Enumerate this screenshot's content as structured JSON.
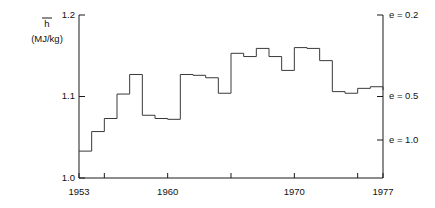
{
  "chart_data": {
    "type": "line",
    "subtype": "step-post",
    "title": "",
    "xlabel": "",
    "ylabel": "h̄ (MJ/kg)",
    "ylabel_symbol": "h",
    "ylabel_units": "(MJ/kg)",
    "xlim": [
      1953,
      1977
    ],
    "ylim": [
      1.0,
      1.2
    ],
    "grid": false,
    "legend": false,
    "y_ticks": [
      1.0,
      1.1,
      1.2
    ],
    "y_tick_labels": [
      "1.0",
      "1.1",
      "1.2"
    ],
    "x_ticks": [
      1953,
      1955,
      1960,
      1965,
      1970,
      1975,
      1977
    ],
    "x_tick_labels": [
      "1953",
      "",
      "1960",
      "",
      "1970",
      "",
      "1977"
    ],
    "x_labelled_ticks": [
      "1953",
      "1960",
      "1970",
      "1977"
    ],
    "right_axis": {
      "label": "e",
      "ticks": [
        {
          "label": "e = 0.2",
          "y_value": 1.2
        },
        {
          "label": "e = 0.5",
          "y_value": 1.1
        },
        {
          "label": "e = 1.0",
          "y_value": 1.047
        }
      ]
    },
    "x": [
      1953,
      1954,
      1955,
      1956,
      1957,
      1958,
      1959,
      1960,
      1961,
      1962,
      1963,
      1964,
      1965,
      1966,
      1967,
      1968,
      1969,
      1970,
      1971,
      1972,
      1973,
      1974,
      1975,
      1976,
      1977
    ],
    "values": [
      1.033,
      1.057,
      1.073,
      1.103,
      1.127,
      1.077,
      1.073,
      1.072,
      1.127,
      1.126,
      1.123,
      1.104,
      1.153,
      1.149,
      1.159,
      1.149,
      1.132,
      1.16,
      1.159,
      1.144,
      1.106,
      1.104,
      1.11,
      1.112,
      1.108
    ],
    "series_name": "mean specific enthalpy"
  },
  "axes": {
    "y_left_label_symbol": "h",
    "y_left_label_units": "(MJ/kg)"
  }
}
